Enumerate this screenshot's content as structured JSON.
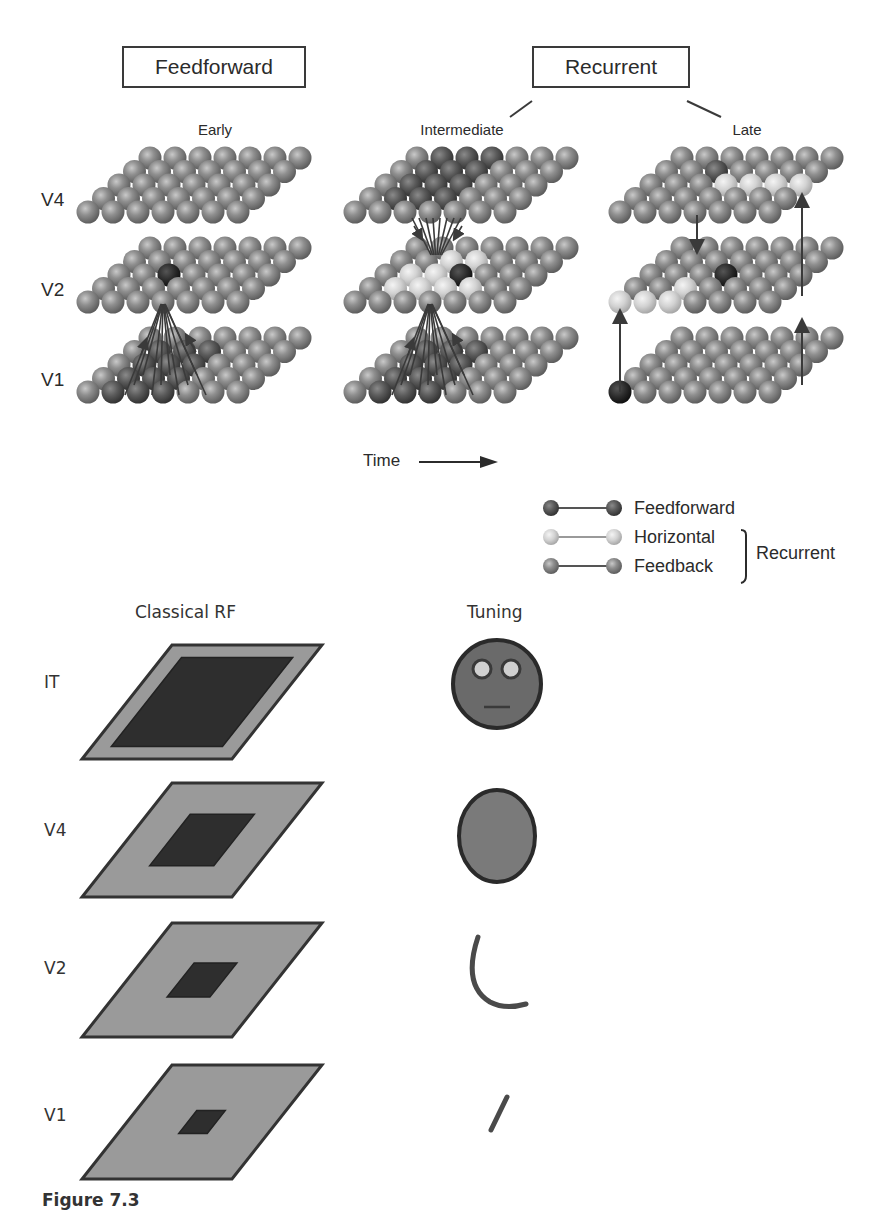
{
  "top_panel": {
    "header_boxes": {
      "feedforward": "Feedforward",
      "recurrent": "Recurrent"
    },
    "stages": [
      "Early",
      "Intermediate",
      "Late"
    ],
    "areas": [
      "V4",
      "V2",
      "V1"
    ],
    "time_label": "Time",
    "time_arrow_icon": "right-arrow",
    "grid": {
      "rows": 5,
      "cols": 7,
      "layers": 3
    },
    "legend": {
      "items": [
        {
          "label": "Feedforward",
          "color": "#6a6a6a"
        },
        {
          "label": "Horizontal",
          "color": "#d8d8d8"
        },
        {
          "label": "Feedback",
          "color": "#7d7d7d"
        }
      ],
      "group_label": "Recurrent"
    }
  },
  "bottom_panel": {
    "columns": {
      "rf": "Classical RF",
      "tuning": "Tuning"
    },
    "rows": [
      {
        "area": "IT",
        "rf_center_scale": 0.78,
        "tuning": "face"
      },
      {
        "area": "V4",
        "rf_center_scale": 0.45,
        "tuning": "filled-circle"
      },
      {
        "area": "V2",
        "rf_center_scale": 0.3,
        "tuning": "curve"
      },
      {
        "area": "V1",
        "rf_center_scale": 0.2,
        "tuning": "line-segment"
      }
    ]
  },
  "caption": "Figure 7.3",
  "colors": {
    "sphere": "#8e8e8e",
    "sphere_dark": "#505050",
    "sphere_light": "#d5d5d5",
    "rf_outer": "#9a9a9a",
    "rf_inner": "#2e2e2e",
    "stroke": "#333333"
  }
}
